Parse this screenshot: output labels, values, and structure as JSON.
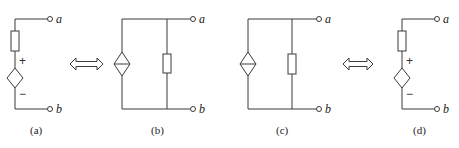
{
  "figure": {
    "panels": [
      {
        "id": "a",
        "caption": "(a)",
        "type": "series dependent voltage source with resistor",
        "terminal_top": "a",
        "terminal_bottom": "b",
        "plus": "+",
        "minus": "−"
      },
      {
        "id": "b",
        "caption": "(b)",
        "type": "parallel dependent current source with resistor",
        "terminal_top": "a",
        "terminal_bottom": "b"
      },
      {
        "id": "c",
        "caption": "(c)",
        "type": "parallel dependent current source with resistor",
        "terminal_top": "a",
        "terminal_bottom": "b"
      },
      {
        "id": "d",
        "caption": "(d)",
        "type": "series dependent voltage source with resistor",
        "terminal_top": "a",
        "terminal_bottom": "b",
        "plus": "+",
        "minus": "−"
      }
    ],
    "equivalence_arrows": [
      {
        "between": [
          "a",
          "b"
        ],
        "icon": "double-arrow-icon"
      },
      {
        "between": [
          "c",
          "d"
        ],
        "icon": "double-arrow-icon"
      }
    ],
    "colors": {
      "line": "#3a3a3a",
      "background": "#ffffff"
    }
  }
}
